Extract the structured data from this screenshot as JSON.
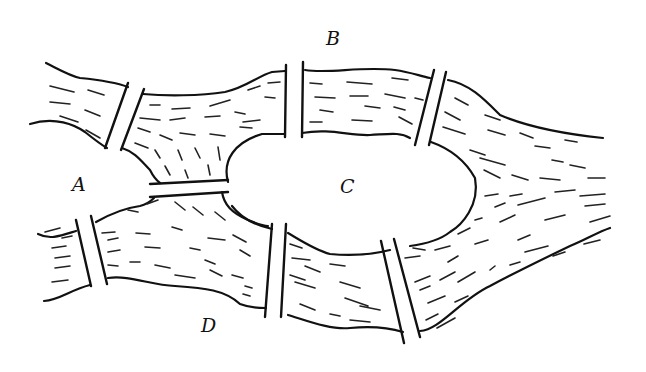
{
  "diagram": {
    "labels": {
      "A": "A",
      "B": "B",
      "C": "C",
      "D": "D"
    },
    "stroke_color": "#111111",
    "background": "#ffffff",
    "regions": [
      {
        "id": "A",
        "description": "western shore between river branches"
      },
      {
        "id": "B",
        "description": "northern bank"
      },
      {
        "id": "C",
        "description": "central island"
      },
      {
        "id": "D",
        "description": "southern bank"
      }
    ],
    "bridge_count": 7
  }
}
